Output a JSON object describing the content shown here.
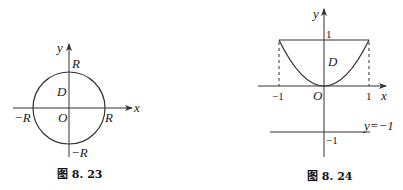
{
  "figures": [
    {
      "id": "fig-8-23",
      "caption": "图 8. 23",
      "labels": {
        "y_axis": "y",
        "x_axis": "x",
        "top": "R",
        "region": "D",
        "origin": "O",
        "left": "−R",
        "right": "R",
        "bottom": "−R"
      },
      "shape": "circle centered at origin with radius R"
    },
    {
      "id": "fig-8-24",
      "caption": "图 8. 24",
      "labels": {
        "y_axis": "y",
        "x_axis": "x",
        "y_tick_1": "1",
        "region": "D",
        "origin": "O",
        "x_tick_neg1": "−1",
        "x_tick_1": "1",
        "line_label": "y=−1",
        "y_tick_neg1": "−1"
      },
      "shape": "region between parabola y=x^2 and line y=1 for x in [-1,1]"
    }
  ],
  "colors": {
    "stroke": "#333333",
    "text": "#222222",
    "background": "#ffffff"
  }
}
